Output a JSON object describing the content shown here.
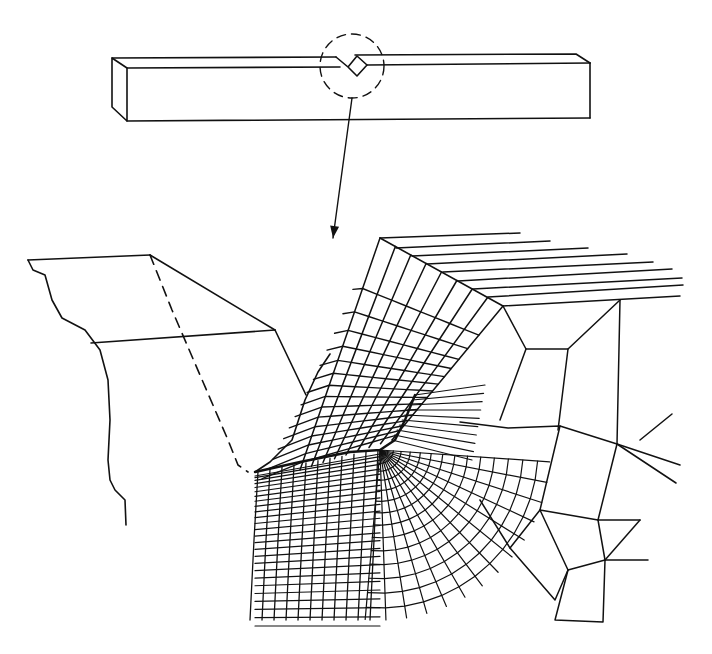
{
  "figure": {
    "background": "#ffffff",
    "stroke_color": "#111111"
  },
  "beam": {
    "outline": [
      [
        112,
        58
      ],
      [
        127,
        68
      ],
      [
        127,
        121
      ],
      [
        112,
        107
      ],
      [
        112,
        58
      ]
    ],
    "front_top": [
      [
        127,
        68
      ],
      [
        340,
        67
      ]
    ],
    "top_back": [
      [
        112,
        58
      ],
      [
        336,
        57
      ]
    ],
    "front_bottom": [
      [
        127,
        121
      ],
      [
        590,
        118
      ]
    ],
    "right_end": [
      [
        590,
        63
      ],
      [
        590,
        118
      ]
    ],
    "right_top_back": [
      [
        355,
        55
      ],
      [
        576,
        54
      ],
      [
        590,
        63
      ]
    ],
    "right_front_top": [
      [
        367,
        65
      ],
      [
        590,
        63
      ]
    ],
    "notch": [
      [
        336,
        57
      ],
      [
        348,
        67
      ],
      [
        357,
        56
      ],
      [
        367,
        65
      ],
      [
        357,
        76
      ],
      [
        348,
        67
      ]
    ],
    "detail_circle": {
      "cx": 352,
      "cy": 66,
      "r": 32
    }
  },
  "leader_arrow": {
    "from": [
      352,
      98
    ],
    "to": [
      333,
      238
    ]
  },
  "left_block": {
    "top_edge": [
      [
        28,
        260
      ],
      [
        150,
        255
      ]
    ],
    "slant_edge": [
      [
        150,
        255
      ],
      [
        275,
        330
      ]
    ],
    "mid_edge": [
      [
        91,
        343
      ],
      [
        275,
        330
      ]
    ],
    "notch_face": [
      [
        275,
        330
      ],
      [
        306,
        395
      ]
    ],
    "dashed_edge": [
      [
        150,
        255
      ],
      [
        172,
        310
      ],
      [
        228,
        440
      ],
      [
        238,
        465
      ],
      [
        248,
        472
      ]
    ],
    "break_curve": [
      [
        28,
        260
      ],
      [
        33,
        270
      ],
      [
        45,
        275
      ],
      [
        52,
        300
      ],
      [
        62,
        318
      ],
      [
        85,
        330
      ],
      [
        100,
        350
      ],
      [
        108,
        380
      ],
      [
        110,
        420
      ],
      [
        108,
        460
      ],
      [
        110,
        480
      ],
      [
        115,
        490
      ],
      [
        125,
        500
      ],
      [
        126,
        525
      ]
    ]
  },
  "mesh": {
    "notch_root": [
      380,
      450
    ],
    "fillet_start": [
      255,
      472
    ],
    "top_corner": [
      380,
      238
    ],
    "shoulder": [
      503,
      306
    ],
    "far_top_lines": [
      [
        [
          380,
          238
        ],
        [
          520,
          233
        ]
      ],
      [
        [
          396,
          248
        ],
        [
          550,
          241
        ]
      ],
      [
        [
          412,
          256
        ],
        [
          588,
          248
        ]
      ],
      [
        [
          427,
          264
        ],
        [
          627,
          254
        ]
      ],
      [
        [
          443,
          272
        ],
        [
          653,
          262
        ]
      ],
      [
        [
          458,
          281
        ],
        [
          672,
          269
        ]
      ],
      [
        [
          473,
          289
        ],
        [
          682,
          278
        ]
      ],
      [
        [
          488,
          297
        ],
        [
          683,
          285
        ]
      ],
      [
        [
          503,
          306
        ],
        [
          680,
          296
        ]
      ]
    ],
    "coarse_region": [
      [
        [
          503,
          306
        ],
        [
          526,
          349
        ],
        [
          568,
          349
        ],
        [
          620,
          300
        ]
      ],
      [
        [
          620,
          300
        ],
        [
          617,
          444
        ],
        [
          680,
          465
        ]
      ],
      [
        [
          526,
          349
        ],
        [
          500,
          420
        ]
      ],
      [
        [
          568,
          349
        ],
        [
          558,
          430
        ]
      ],
      [
        [
          460,
          422
        ],
        [
          508,
          428
        ],
        [
          560,
          426
        ],
        [
          617,
          444
        ]
      ],
      [
        [
          617,
          444
        ],
        [
          598,
          520
        ],
        [
          640,
          520
        ]
      ],
      [
        [
          560,
          426
        ],
        [
          540,
          510
        ],
        [
          598,
          520
        ]
      ],
      [
        [
          540,
          510
        ],
        [
          568,
          570
        ],
        [
          605,
          560
        ],
        [
          648,
          560
        ]
      ],
      [
        [
          598,
          520
        ],
        [
          605,
          560
        ]
      ],
      [
        [
          568,
          570
        ],
        [
          555,
          620
        ],
        [
          603,
          622
        ],
        [
          605,
          560
        ]
      ],
      [
        [
          540,
          510
        ],
        [
          510,
          548
        ],
        [
          555,
          600
        ],
        [
          568,
          570
        ]
      ],
      [
        [
          510,
          548
        ],
        [
          480,
          500
        ]
      ],
      [
        [
          605,
          560
        ],
        [
          640,
          520
        ]
      ],
      [
        [
          672,
          414
        ],
        [
          640,
          440
        ]
      ],
      [
        [
          676,
          483
        ],
        [
          617,
          444
        ]
      ]
    ]
  }
}
